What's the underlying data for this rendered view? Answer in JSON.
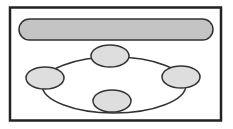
{
  "diagram": {
    "frame": {
      "x": 9,
      "y": 7,
      "w": 212,
      "h": 114,
      "stroke": "#222222"
    },
    "bar": {
      "x": 19,
      "y": 19,
      "w": 194,
      "h": 21,
      "fill": "#c4c4c4",
      "stroke": "#333333"
    },
    "ring": {
      "cx": 114,
      "cy": 85,
      "rx": 72,
      "ry": 28,
      "stroke": "#333333"
    },
    "nodes": [
      {
        "name": "top",
        "cx": 110,
        "cy": 56,
        "rx": 19,
        "ry": 11
      },
      {
        "name": "left",
        "cx": 45,
        "cy": 78,
        "rx": 19,
        "ry": 11
      },
      {
        "name": "right",
        "cx": 181,
        "cy": 77,
        "rx": 19,
        "ry": 11
      },
      {
        "name": "bottom",
        "cx": 112,
        "cy": 101,
        "rx": 19,
        "ry": 11
      }
    ],
    "node_fill": "#dedede",
    "node_stroke": "#333333"
  }
}
